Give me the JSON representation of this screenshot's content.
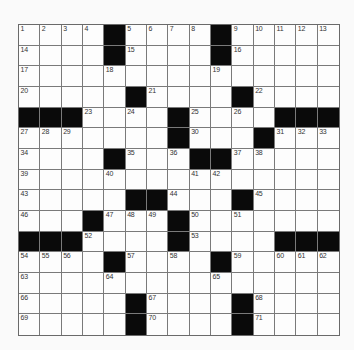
{
  "puzzle": {
    "rows": 15,
    "cols": 15,
    "colors": {
      "black_square": "#0a0a0a",
      "white_square": "#fdfdfd",
      "grid_line": "#7a7a7a"
    },
    "layout": [
      "....#....#.....",
      "....#....#.....",
      "...............",
      ".....#....#....",
      "###....#....###",
      ".......#...#...",
      "....#...##.....",
      "...............",
      ".....##...#....",
      "...#...#.......",
      "###....#....###",
      "....#....#.....",
      "...............",
      ".....#....#....",
      ".....#....#...."
    ],
    "numbers": [
      [
        1,
        2,
        3,
        4,
        0,
        5,
        6,
        7,
        8,
        0,
        9,
        10,
        11,
        12,
        13
      ],
      [
        14,
        0,
        0,
        0,
        0,
        15,
        0,
        0,
        0,
        0,
        16,
        0,
        0,
        0,
        0
      ],
      [
        17,
        0,
        0,
        0,
        18,
        0,
        0,
        0,
        0,
        19,
        0,
        0,
        0,
        0,
        0
      ],
      [
        20,
        0,
        0,
        0,
        0,
        0,
        21,
        0,
        0,
        0,
        0,
        22,
        0,
        0,
        0
      ],
      [
        0,
        0,
        0,
        23,
        0,
        24,
        0,
        0,
        25,
        0,
        26,
        0,
        0,
        0,
        0
      ],
      [
        27,
        28,
        29,
        0,
        0,
        0,
        0,
        0,
        30,
        0,
        0,
        0,
        31,
        32,
        33
      ],
      [
        34,
        0,
        0,
        0,
        0,
        35,
        0,
        36,
        0,
        0,
        37,
        38,
        0,
        0,
        0
      ],
      [
        39,
        0,
        0,
        0,
        40,
        0,
        0,
        0,
        41,
        42,
        0,
        0,
        0,
        0,
        0
      ],
      [
        43,
        0,
        0,
        0,
        0,
        0,
        0,
        44,
        0,
        0,
        0,
        45,
        0,
        0,
        0
      ],
      [
        46,
        0,
        0,
        0,
        47,
        48,
        49,
        0,
        50,
        0,
        51,
        0,
        0,
        0,
        0
      ],
      [
        0,
        0,
        0,
        52,
        0,
        0,
        0,
        0,
        53,
        0,
        0,
        0,
        0,
        0,
        0
      ],
      [
        54,
        55,
        56,
        0,
        0,
        57,
        0,
        58,
        0,
        0,
        59,
        0,
        60,
        61,
        62
      ],
      [
        63,
        0,
        0,
        0,
        64,
        0,
        0,
        0,
        0,
        65,
        0,
        0,
        0,
        0,
        0
      ],
      [
        66,
        0,
        0,
        0,
        0,
        0,
        67,
        0,
        0,
        0,
        0,
        68,
        0,
        0,
        0
      ],
      [
        69,
        0,
        0,
        0,
        0,
        0,
        70,
        0,
        0,
        0,
        0,
        71,
        0,
        0,
        0
      ]
    ],
    "letters": [
      "               ",
      "               ",
      "               ",
      "               ",
      "               ",
      "               ",
      "               ",
      "               ",
      "               ",
      "               ",
      "               ",
      "               ",
      "               ",
      "               ",
      "               "
    ]
  }
}
